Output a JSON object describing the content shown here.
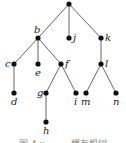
{
  "diagram": {
    "type": "rooted-tree",
    "nodes": [
      {
        "id": "root",
        "label": "",
        "x": 69,
        "y": 4
      },
      {
        "id": "b",
        "label": "b",
        "x": 38,
        "y": 38
      },
      {
        "id": "j",
        "label": "j",
        "x": 69,
        "y": 38
      },
      {
        "id": "k",
        "label": "k",
        "x": 101,
        "y": 38
      },
      {
        "id": "c",
        "label": "c",
        "x": 14,
        "y": 64
      },
      {
        "id": "e",
        "label": "e",
        "x": 38,
        "y": 64
      },
      {
        "id": "f",
        "label": "f",
        "x": 61,
        "y": 64
      },
      {
        "id": "l",
        "label": "l",
        "x": 101,
        "y": 64
      },
      {
        "id": "d",
        "label": "d",
        "x": 14,
        "y": 93
      },
      {
        "id": "g",
        "label": "g",
        "x": 46,
        "y": 93
      },
      {
        "id": "i",
        "label": "i",
        "x": 76,
        "y": 93
      },
      {
        "id": "m",
        "label": "m",
        "x": 86,
        "y": 93
      },
      {
        "id": "n",
        "label": "n",
        "x": 116,
        "y": 93
      },
      {
        "id": "h",
        "label": "h",
        "x": 46,
        "y": 122
      }
    ],
    "edges": [
      [
        "root",
        "b"
      ],
      [
        "root",
        "j"
      ],
      [
        "root",
        "k"
      ],
      [
        "b",
        "c"
      ],
      [
        "b",
        "e"
      ],
      [
        "b",
        "f"
      ],
      [
        "k",
        "l"
      ],
      [
        "c",
        "d"
      ],
      [
        "f",
        "g"
      ],
      [
        "f",
        "i"
      ],
      [
        "l",
        "m"
      ],
      [
        "l",
        "n"
      ],
      [
        "g",
        "h"
      ]
    ]
  },
  "labels": {
    "b": "b",
    "j": "j",
    "k": "k",
    "c": "c",
    "e": "e",
    "f": "f",
    "l": "l",
    "d": "d",
    "g": "g",
    "i": "i",
    "m": "m",
    "n": "n",
    "h": "h"
  },
  "caption": "图 4.x      一棵有根树"
}
